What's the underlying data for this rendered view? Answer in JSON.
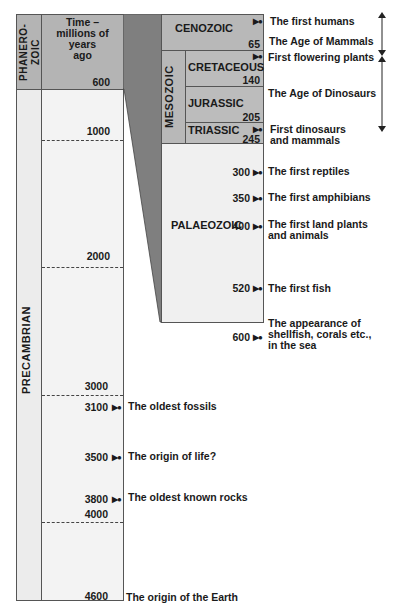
{
  "columns": {
    "eon_top": "PHANERO-\nZOIC",
    "eon_bottom": "PRECAMBRIAN",
    "time_header": "Time –\nmillions of\nyears\nago"
  },
  "precambrian_ticks": [
    "600",
    "1000",
    "2000",
    "3000",
    "4000"
  ],
  "precambrian_events": [
    {
      "age": "3100",
      "text": "The oldest fossils"
    },
    {
      "age": "3500",
      "text": "The origin of life?"
    },
    {
      "age": "3800",
      "text": "The oldest known rocks"
    },
    {
      "age": "4600",
      "text": "The origin of the Earth"
    }
  ],
  "eras": {
    "cenozoic": "CENOZOIC",
    "mesozoic": "MESOZOIC",
    "palaeozoic": "PALAEOZOIC"
  },
  "periods": [
    {
      "name": "CRETACEOUS",
      "end": "140"
    },
    {
      "name": "JURASSIC",
      "end": "205"
    },
    {
      "name": "TRIASSIC",
      "end": "245"
    }
  ],
  "boundary_65": "65",
  "phanerozoic_events": [
    {
      "age": "",
      "text": "The first humans"
    },
    {
      "age": "",
      "text": "The Age of Mammals"
    },
    {
      "age": "",
      "text": "First flowering plants"
    },
    {
      "age": "",
      "text": "The Age of Dinosaurs"
    },
    {
      "age": "",
      "text": "First dinosaurs\nand mammals"
    },
    {
      "age": "300",
      "text": "The first reptiles"
    },
    {
      "age": "350",
      "text": "The first amphibians"
    },
    {
      "age": "400",
      "text": "The first land plants\nand animals"
    },
    {
      "age": "520",
      "text": "The first fish"
    },
    {
      "age": "600",
      "text": "The appearance of\nshellfish, corals etc.,\nin the sea"
    }
  ],
  "colors": {
    "dark_gray": "#8a8a8a",
    "mid_gray": "#b8b8b8",
    "light_gray": "#efefef",
    "wedge": "#7f7f7f"
  }
}
